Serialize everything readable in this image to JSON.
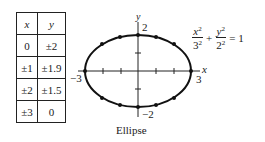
{
  "table": {
    "headers": [
      "x",
      "y"
    ],
    "rows": [
      [
        "0",
        "±2"
      ],
      [
        "±1",
        "±1.9"
      ],
      [
        "±2",
        "±1.5"
      ],
      [
        "±3",
        "0"
      ]
    ]
  },
  "graph": {
    "x_axis_label": "x",
    "y_axis_label": "y",
    "labels": {
      "x_neg": "−3",
      "x_pos": "3",
      "y_pos": "2",
      "y_neg": "−2"
    },
    "semi_major": 3,
    "semi_minor": 2
  },
  "equation": {
    "term1_num": "x",
    "term1_num_exp": "2",
    "term1_den": "3",
    "term1_den_exp": "2",
    "plus": "+",
    "term2_num": "y",
    "term2_num_exp": "2",
    "term2_den": "2",
    "term2_den_exp": "2",
    "equals": "= 1"
  },
  "caption": "Ellipse"
}
